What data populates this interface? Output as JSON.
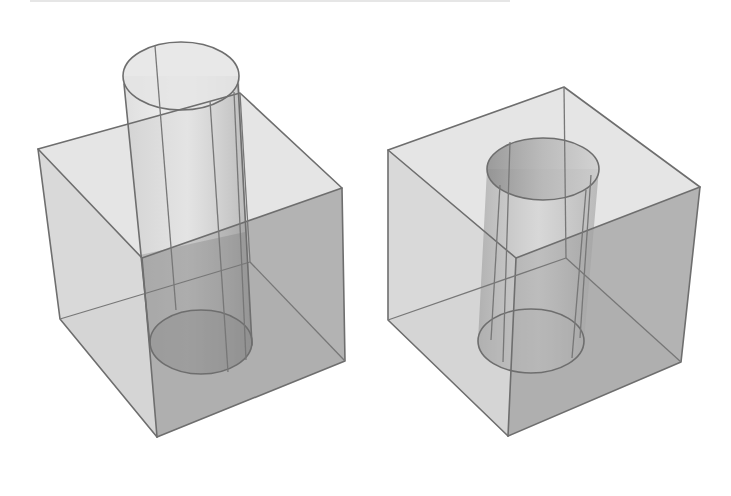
{
  "figure": {
    "colors": {
      "background": "#ffffff",
      "edge": "#6e6e6e",
      "top_face": "#dcdcdc",
      "left_face": "#cfcfcf",
      "right_face": "#a8a8a8",
      "cylinder": "#bdbdbd",
      "cylinder_dark": "#8f8f8f"
    },
    "panels": [
      {
        "name": "cube-with-protruding-cylinder",
        "cube": {
          "top_left": [
            38,
            149
          ],
          "top_back": [
            240,
            93
          ],
          "top_right": [
            342,
            188
          ],
          "top_front": [
            142,
            258
          ],
          "bottom_left": [
            60,
            319
          ],
          "bottom_back": [
            250,
            262
          ],
          "bottom_right": [
            345,
            361
          ],
          "bottom_front": [
            157,
            437
          ]
        },
        "cylinder": {
          "top": {
            "cx": 181,
            "cy": 76,
            "rx": 58,
            "ry": 34
          },
          "bottom": {
            "cx": 201,
            "cy": 342,
            "rx": 51,
            "ry": 32
          }
        }
      },
      {
        "name": "cube-with-cylindrical-hole",
        "cube": {
          "top_left": [
            388,
            150
          ],
          "top_back": [
            564,
            87
          ],
          "top_right": [
            700,
            187
          ],
          "top_front": [
            516,
            258
          ],
          "bottom_left": [
            388,
            320
          ],
          "bottom_back": [
            566,
            258
          ],
          "bottom_right": [
            681,
            362
          ],
          "bottom_front": [
            508,
            436
          ]
        },
        "cylinder": {
          "top": {
            "cx": 543,
            "cy": 169,
            "rx": 56,
            "ry": 31
          },
          "bottom": {
            "cx": 531,
            "cy": 341,
            "rx": 53,
            "ry": 32
          }
        }
      }
    ]
  }
}
